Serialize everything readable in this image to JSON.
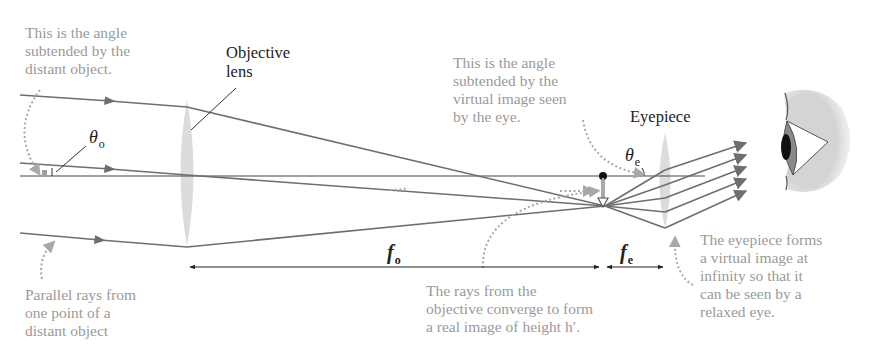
{
  "labels": {
    "objective_lens": "Objective\nlens",
    "eyepiece": "Eyepiece"
  },
  "annotations": {
    "angle_object": "This is the angle\nsubtended by the\ndistant object.",
    "angle_virtual_image": "This is the angle\nsubtended by the\nvirtual image seen\nby the eye.",
    "parallel_rays": "Parallel rays from\none point of a\ndistant object",
    "real_image": "The rays from the\nobjective converge to form\na real image of height h′.",
    "virtual_image": "The eyepiece forms\na virtual image at\ninfinity so that it\ncan be seen by a\nrelaxed eye."
  },
  "symbols": {
    "theta_o": {
      "main": "θ",
      "sub": "o"
    },
    "theta_e": {
      "main": "θ",
      "sub": "e"
    },
    "f_o": {
      "main": "f",
      "sub": "o"
    },
    "f_e": {
      "main": "f",
      "sub": "e"
    }
  },
  "colors": {
    "ray": "#6e6e6e",
    "axis": "#444444",
    "lens": "#d9d9d9",
    "annotation_text": "#9a9a9a",
    "label_text": "#222222",
    "eye_skin": "#d6d6d6",
    "iris": "#8a8a8a",
    "pupil": "#111111"
  }
}
